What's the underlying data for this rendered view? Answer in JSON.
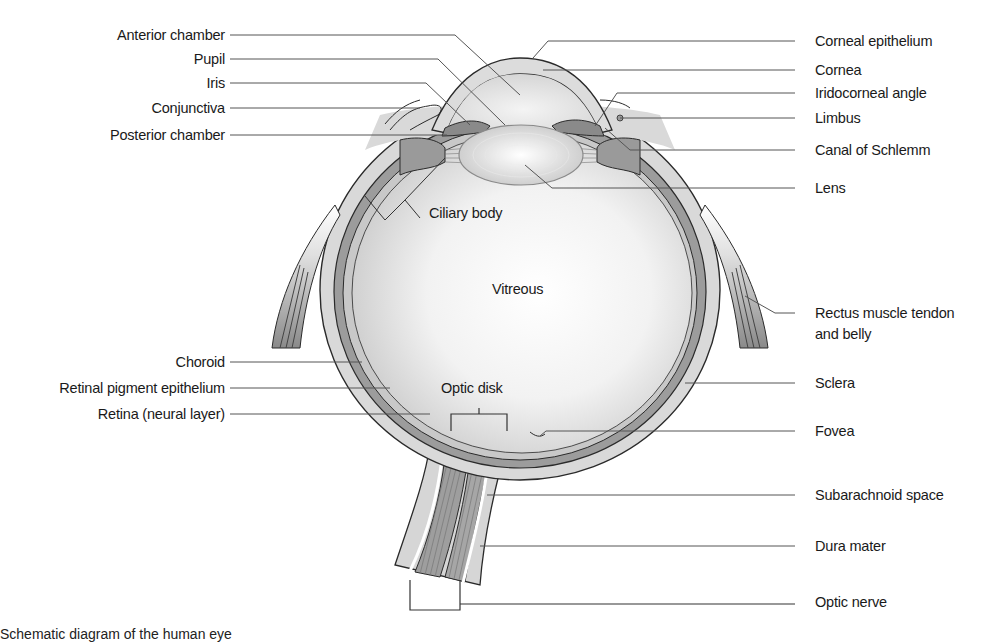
{
  "diagram": {
    "colors": {
      "tissue_light": "#d9d9d9",
      "tissue_mid": "#a8a8a8",
      "tissue_dark": "#7a7a7a",
      "outline": "#2a2a2a",
      "leader": "#555555",
      "background": "#ffffff"
    },
    "left_labels": [
      {
        "id": "anterior-chamber",
        "text": "Anterior chamber",
        "y": 35
      },
      {
        "id": "pupil",
        "text": "Pupil",
        "y": 59
      },
      {
        "id": "iris",
        "text": "Iris",
        "y": 83
      },
      {
        "id": "conjunctiva",
        "text": "Conjunctiva",
        "y": 108
      },
      {
        "id": "posterior-chamber",
        "text": "Posterior chamber",
        "y": 135
      },
      {
        "id": "choroid",
        "text": "Choroid",
        "y": 362
      },
      {
        "id": "retinal-pigment-epithelium",
        "text": "Retinal pigment epithelium",
        "y": 388
      },
      {
        "id": "retina-neural-layer",
        "text": "Retina (neural layer)",
        "y": 414
      }
    ],
    "right_labels": [
      {
        "id": "corneal-epithelium",
        "text": "Corneal epithelium",
        "y": 41
      },
      {
        "id": "cornea",
        "text": "Cornea",
        "y": 70
      },
      {
        "id": "iridocorneal-angle",
        "text": "Iridocorneal angle",
        "y": 93
      },
      {
        "id": "limbus",
        "text": "Limbus",
        "y": 118
      },
      {
        "id": "canal-of-schlemm",
        "text": "Canal of Schlemm",
        "y": 150
      },
      {
        "id": "lens",
        "text": "Lens",
        "y": 188
      },
      {
        "id": "rectus-muscle",
        "text": "Rectus muscle tendon",
        "text2": "and belly",
        "y": 313
      },
      {
        "id": "sclera",
        "text": "Sclera",
        "y": 383
      },
      {
        "id": "fovea",
        "text": "Fovea",
        "y": 431
      },
      {
        "id": "subarachnoid-space",
        "text": "Subarachnoid space",
        "y": 495
      },
      {
        "id": "dura-mater",
        "text": "Dura mater",
        "y": 546
      },
      {
        "id": "optic-nerve",
        "text": "Optic nerve",
        "y": 602
      }
    ],
    "inner_labels": {
      "ciliary_body": "Ciliary body",
      "vitreous": "Vitreous",
      "optic_disk": "Optic disk"
    },
    "caption": "Schematic diagram of the human eye"
  }
}
